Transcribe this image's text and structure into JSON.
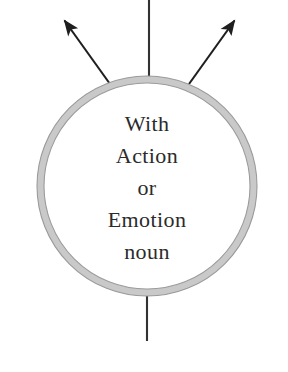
{
  "diagram": {
    "type": "node-with-edges",
    "background_color": "#ffffff",
    "node": {
      "name": "central-circle-node",
      "shape": "circle",
      "center_x": 147,
      "center_y": 186,
      "radius": 110,
      "ring_fill_color": "#c9c9c9",
      "ring_edge_color": "#9a9a9a",
      "interior_fill_color": "#ffffff",
      "ring_thickness": 7,
      "label_color": "#2b2b2b",
      "label_lines": [
        {
          "text": "With",
          "y": 126
        },
        {
          "text": "Action",
          "y": 158
        },
        {
          "text": "or",
          "y": 190
        },
        {
          "text": "Emotion",
          "y": 222
        },
        {
          "text": "noun",
          "y": 254
        }
      ],
      "label_full_text": "With Action or Emotion noun"
    },
    "edges": [
      {
        "name": "edge-top-vertical",
        "style": "plain-line",
        "color": "#333333",
        "width": 2,
        "x1": 149,
        "y1": 0,
        "x2": 149,
        "y2": 78
      },
      {
        "name": "edge-upper-left-arrow",
        "style": "arrow",
        "color": "#1f1f1f",
        "width": 2,
        "x1": 110,
        "y1": 84,
        "x2": 61,
        "y2": 16
      },
      {
        "name": "edge-upper-right-arrow",
        "style": "arrow",
        "color": "#1f1f1f",
        "width": 2,
        "x1": 189,
        "y1": 84,
        "x2": 238,
        "y2": 16
      },
      {
        "name": "edge-bottom-vertical",
        "style": "plain-line",
        "color": "#333333",
        "width": 2,
        "x1": 147,
        "y1": 295,
        "x2": 147,
        "y2": 341
      }
    ]
  }
}
